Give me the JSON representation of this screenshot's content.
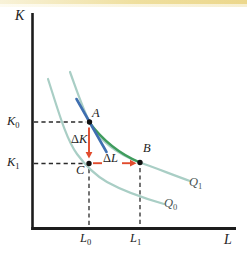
{
  "figure": {
    "axis_labels": {
      "y": "K",
      "x": "L"
    },
    "tick_labels": {
      "k0": {
        "base": "K",
        "sub": "0"
      },
      "k1": {
        "base": "K",
        "sub": "1"
      },
      "l0": {
        "base": "L",
        "sub": "0"
      },
      "l1": {
        "base": "L",
        "sub": "1"
      }
    },
    "point_labels": {
      "a": "A",
      "b": "B",
      "c": "C"
    },
    "curve_labels": {
      "q0": {
        "base": "Q",
        "sub": "0"
      },
      "q1": {
        "base": "Q",
        "sub": "1"
      }
    },
    "delta_labels": {
      "dk": {
        "symbol": "Δ",
        "var": "K"
      },
      "dl": {
        "symbol": "Δ",
        "var": "L"
      }
    },
    "colors": {
      "axis": "#1c1c1c",
      "dashed": "#2a2a2a",
      "isoquant": "#a9cec5",
      "chord": "#3f9c5d",
      "tangent": "#3f6fb0",
      "arrow": "#e14b2d",
      "point": "#111111"
    }
  },
  "paths": {
    "y_axis": "M 32.5 13 L 32.5 230",
    "x_axis": "M 31.2 228.5 L 236 228.5",
    "dash_k0": "M 34 122 L 86 122",
    "dash_k1": "M 34 163.5 L 85 163.5",
    "dash_l0": "M 89 169 L 89 226",
    "dash_l1": "M 140 168 L 140 226",
    "q0": "M 48 79 C 58 110 66 139 77 154 C 85 165 95 175 107 182 C 125 192 143 198 164 204",
    "q1": "M 70 72 C 78 94 83 109 89.5 122 C 99 140 117 154 140 162.5 C 156 168 173 175 190 181",
    "chord": "M 89.5 122.5 Q 110 150 140 162.5",
    "tangent": "M 76.5 99 L 106.5 152",
    "arrow_dk_shaft": "M 89 127.5 L 89 152.5",
    "arrow_dk_head": "M 89 158.5 L 85.6 152 L 92.4 152 Z",
    "arrow_dl_seg": "M 93 163.2 L 102 163.2",
    "arrow_dl_shaft": "M 122 163.2 L 131.5 163.2",
    "arrow_dl_head": "M 136.5 163.2 L 130 159.8 L 130 166.6 Z",
    "dots": "M 89.5 122 m -2.7 0 a 2.7 2.7 0 1 0 5.4 0 a 2.7 2.7 0 1 0 -5.4 0 M 140 162.5 m -2.7 0 a 2.7 2.7 0 1 0 5.4 0 a 2.7 2.7 0 1 0 -5.4 0 M 89 163.5 m -2.7 0 a 2.7 2.7 0 1 0 5.4 0 a 2.7 2.7 0 1 0 -5.4 0"
  },
  "chart_data": {
    "type": "line",
    "title": "",
    "xlabel": "L",
    "ylabel": "K",
    "axis_numeric": false,
    "xlim": [
      0,
      10
    ],
    "ylim": [
      0,
      10
    ],
    "grid": false,
    "legend": false,
    "tick_labels": {
      "x": [
        "L0",
        "L1"
      ],
      "y": [
        "K0",
        "K1"
      ]
    },
    "series": [
      {
        "name": "Q0",
        "role": "isoquant",
        "color": "#a9cec5",
        "x": [
          0.8,
          1.4,
          2.25,
          3.15,
          4.4,
          5.4,
          6.6
        ],
        "y": [
          7.5,
          5.7,
          3.7,
          2.7,
          1.9,
          1.6,
          1.2
        ]
      },
      {
        "name": "Q1",
        "role": "isoquant",
        "color": "#a9cec5",
        "x": [
          1.9,
          2.9,
          3.4,
          4.4,
          5.4,
          6.65,
          7.9
        ],
        "y": [
          7.8,
          5.3,
          4.4,
          3.6,
          3.3,
          2.8,
          2.4
        ]
      },
      {
        "name": "tangent at A",
        "role": "tangent",
        "color": "#3f6fb0",
        "x": [
          2.2,
          3.7
        ],
        "y": [
          6.5,
          3.85
        ]
      },
      {
        "name": "chord A to B",
        "role": "secant",
        "color": "#3f9c5d",
        "x": [
          2.9,
          5.4
        ],
        "y": [
          5.3,
          3.3
        ]
      }
    ],
    "points": [
      {
        "label": "A",
        "x": 2.9,
        "y": 5.3,
        "x_tick": "L0",
        "y_tick": "K0"
      },
      {
        "label": "B",
        "x": 5.4,
        "y": 3.3,
        "x_tick": "L1",
        "y_tick": "K1"
      },
      {
        "label": "C",
        "x": 2.9,
        "y": 3.3,
        "x_tick": "L0",
        "y_tick": "K1"
      }
    ],
    "annotations": [
      {
        "text": "ΔK",
        "between": [
          "A",
          "C"
        ],
        "arrow_color": "#e14b2d"
      },
      {
        "text": "ΔL",
        "between": [
          "C",
          "B"
        ],
        "arrow_color": "#e14b2d"
      }
    ]
  }
}
